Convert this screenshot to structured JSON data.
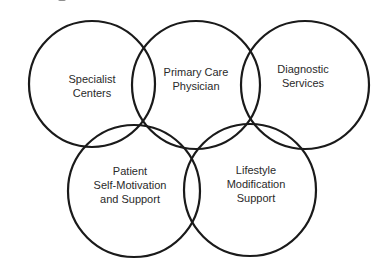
{
  "diagram": {
    "type": "venn-ring",
    "stroke_color": "#1a1a1a",
    "text_color": "#2a2a2a",
    "circles": [
      {
        "id": "specialist-centers",
        "cx": 92,
        "cy": 84,
        "r": 63,
        "lines": [
          "Specialist",
          "Centers"
        ],
        "label_x": 92,
        "label_y": 72
      },
      {
        "id": "primary-care-physician",
        "cx": 196,
        "cy": 85,
        "r": 64,
        "lines": [
          "Primary Care",
          "Physician"
        ],
        "label_x": 196,
        "label_y": 65
      },
      {
        "id": "diagnostic-services",
        "cx": 305,
        "cy": 85,
        "r": 64,
        "lines": [
          "Diagnostic",
          "Services"
        ],
        "label_x": 303,
        "label_y": 62
      },
      {
        "id": "patient-self-motivation",
        "cx": 134,
        "cy": 191,
        "r": 66,
        "lines": [
          "Patient",
          "Self-Motivation",
          "and Support"
        ],
        "label_x": 130,
        "label_y": 164
      },
      {
        "id": "lifestyle-modification",
        "cx": 250,
        "cy": 190,
        "r": 66,
        "lines": [
          "Lifestyle",
          "Modification",
          "Support"
        ],
        "label_x": 256,
        "label_y": 163
      }
    ]
  }
}
